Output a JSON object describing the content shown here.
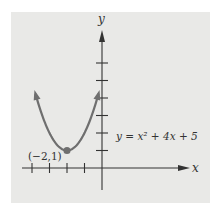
{
  "chart_data": {
    "type": "line",
    "title": "",
    "xlabel": "x",
    "ylabel": "y",
    "equation_label": "y = x² + 4x + 5",
    "function": {
      "a": 1,
      "b": 4,
      "c": 5
    },
    "x_range": [
      -3.8,
      -0.2
    ],
    "vertex": {
      "x": -2,
      "y": 1,
      "label": "(−2,1)"
    },
    "x_ticks": [
      -4,
      -3,
      -2,
      -1
    ],
    "y_ticks": [
      1,
      2,
      3,
      4,
      5,
      6
    ],
    "xlim": [
      -4.0,
      4.0
    ],
    "ylim": [
      -1.2,
      7.8
    ],
    "grid": false,
    "colors": {
      "curve": "#6f6f6f",
      "axis": "#333333",
      "background": "#e9e9e7"
    }
  }
}
